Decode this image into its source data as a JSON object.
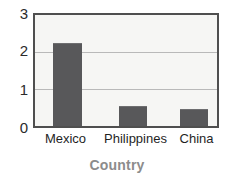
{
  "chart_data": {
    "type": "bar",
    "title": "",
    "subtitle": "",
    "xlabel": "Country",
    "ylabel": "",
    "categories": [
      "Mexico",
      "Philippines",
      "China"
    ],
    "values": [
      2.25,
      0.55,
      0.47
    ],
    "series": [
      {
        "name": "",
        "values": [
          2.25,
          0.55,
          0.47
        ]
      }
    ],
    "ylim": [
      0,
      3
    ],
    "yticks": [
      "0",
      "1",
      "2",
      "3"
    ],
    "ytick_values": [
      0,
      1,
      2,
      3
    ],
    "grid": "horizontal",
    "legend": "none",
    "annotations": [],
    "colors": {
      "bar": "#58585a",
      "plot_background": "#f6f6f4",
      "plot_border": "#4f4f4f",
      "gridline": "#b9b9b9",
      "tick_label": "#2b2b2b",
      "axis_title": "#8c8c8c",
      "page_background": "#ffffff"
    }
  }
}
